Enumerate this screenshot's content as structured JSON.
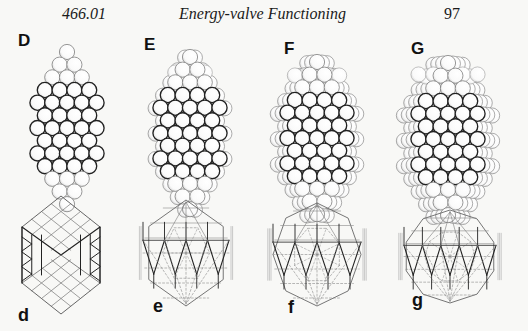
{
  "header": {
    "section_number": "466.01",
    "title": "Energy-valve Functioning",
    "page_number": "97"
  },
  "figure": {
    "upper_row": [
      {
        "label": "D",
        "label_pos": [
          18,
          32
        ],
        "cx": 67,
        "top": 52,
        "r": 7.6,
        "type": "rhombic",
        "depth": 0
      },
      {
        "label": "E",
        "label_pos": [
          144,
          36
        ],
        "cx": 190,
        "top": 57,
        "r": 7.6,
        "type": "rhombic",
        "depth": 1
      },
      {
        "label": "F",
        "label_pos": [
          284,
          40
        ],
        "cx": 317,
        "top": 62,
        "r": 7.6,
        "type": "rhombic",
        "depth": 2
      },
      {
        "label": "G",
        "label_pos": [
          411,
          40
        ],
        "cx": 448,
        "top": 63,
        "r": 7.6,
        "type": "rhombic",
        "depth": 3
      }
    ],
    "lower_row": [
      {
        "label": "d",
        "label_pos": [
          18,
          306
        ],
        "cx": 61,
        "top": 196,
        "type": "d"
      },
      {
        "label": "e",
        "label_pos": [
          153,
          297
        ],
        "cx": 186,
        "top": 200,
        "type": "e"
      },
      {
        "label": "f",
        "label_pos": [
          288,
          298
        ],
        "cx": 317,
        "top": 203,
        "type": "f"
      },
      {
        "label": "g",
        "label_pos": [
          412,
          291
        ],
        "cx": 450,
        "top": 210,
        "type": "g"
      }
    ],
    "colors": {
      "ink": "#222222",
      "sphere_fill": "#ffffff",
      "sphere_shade": "#cfcfcf",
      "faint": "#8a8a8a"
    }
  }
}
